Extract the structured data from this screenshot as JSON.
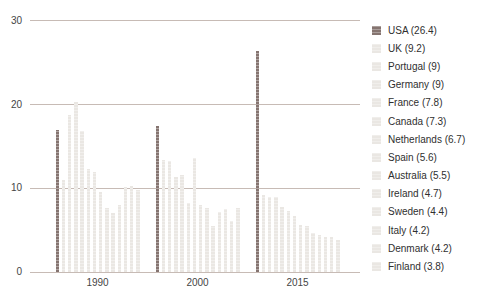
{
  "chart_data": {
    "type": "bar",
    "title": "",
    "xlabel": "",
    "ylabel": "",
    "categories": [
      "1990",
      "2000",
      "2015"
    ],
    "yticks": [
      0,
      10,
      20,
      30
    ],
    "ylim": [
      0,
      30
    ],
    "grid": true,
    "legend_position": "right",
    "series": [
      {
        "name": "USA",
        "legend_label": "USA (26.4)",
        "color": "#857470",
        "values": [
          17.0,
          17.5,
          26.4
        ]
      },
      {
        "name": "UK",
        "legend_label": "UK (9.2)",
        "color": "#eae7e3",
        "values": [
          11.0,
          13.4,
          9.2
        ]
      },
      {
        "name": "Portugal",
        "legend_label": "Portugal (9)",
        "color": "#eae7e3",
        "values": [
          18.8,
          13.3,
          9.0
        ]
      },
      {
        "name": "Germany",
        "legend_label": "Germany (9)",
        "color": "#eae7e3",
        "values": [
          20.3,
          11.4,
          9.0
        ]
      },
      {
        "name": "France",
        "legend_label": "France (7.8)",
        "color": "#eae7e3",
        "values": [
          16.9,
          11.6,
          7.8
        ]
      },
      {
        "name": "Canada",
        "legend_label": "Canada (7.3)",
        "color": "#eae7e3",
        "values": [
          12.3,
          8.3,
          7.3
        ]
      },
      {
        "name": "Netherlands",
        "legend_label": "Netherlands (6.7)",
        "color": "#eae7e3",
        "values": [
          11.9,
          13.6,
          6.7
        ]
      },
      {
        "name": "Spain",
        "legend_label": "Spain (5.6)",
        "color": "#eae7e3",
        "values": [
          9.6,
          8.0,
          5.6
        ]
      },
      {
        "name": "Australia",
        "legend_label": "Australia (5.5)",
        "color": "#eae7e3",
        "values": [
          7.6,
          7.6,
          5.5
        ]
      },
      {
        "name": "Ireland",
        "legend_label": "Ireland (4.7)",
        "color": "#eae7e3",
        "values": [
          7.0,
          5.5,
          4.7
        ]
      },
      {
        "name": "Sweden",
        "legend_label": "Sweden (4.4)",
        "color": "#eae7e3",
        "values": [
          8.0,
          7.2,
          4.4
        ]
      },
      {
        "name": "Italy",
        "legend_label": "Italy (4.2)",
        "color": "#eae7e3",
        "values": [
          10.2,
          7.5,
          4.2
        ]
      },
      {
        "name": "Denmark",
        "legend_label": "Denmark (4.2)",
        "color": "#eae7e3",
        "values": [
          10.3,
          6.1,
          4.2
        ]
      },
      {
        "name": "Finland",
        "legend_label": "Finland (3.8)",
        "color": "#eae7e3",
        "values": [
          9.8,
          7.6,
          3.8
        ]
      }
    ],
    "colors": {
      "accent_bar": "#857470",
      "default_bar": "#eae7e3",
      "gridline": "#c7bbb5",
      "axis_text": "#454545",
      "legend_text": "#2f2f2f",
      "background": "#ffffff"
    }
  }
}
